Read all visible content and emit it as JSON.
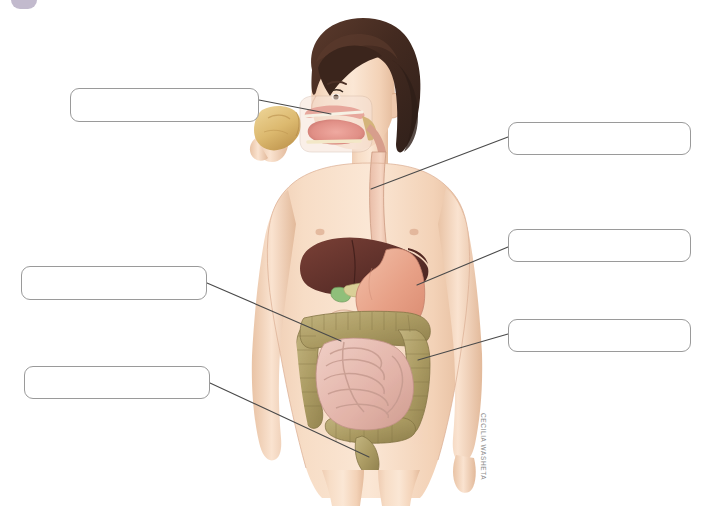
{
  "page": {
    "width": 713,
    "height": 510,
    "background": "#ffffff"
  },
  "credit": {
    "artist": "CECILIA WASHETA"
  },
  "answer_boxes": [
    {
      "id": "box-mouth",
      "label": "",
      "placeholder": "",
      "x": 70,
      "y": 88,
      "w": 189,
      "h": 34,
      "target_organ": "mouth"
    },
    {
      "id": "box-esophagus",
      "label": "",
      "placeholder": "",
      "x": 508,
      "y": 122,
      "w": 183,
      "h": 33,
      "target_organ": "esophagus"
    },
    {
      "id": "box-stomach",
      "label": "",
      "placeholder": "",
      "x": 508,
      "y": 229,
      "w": 183,
      "h": 33,
      "target_organ": "stomach"
    },
    {
      "id": "box-large-intestine",
      "label": "",
      "placeholder": "",
      "x": 21,
      "y": 266,
      "w": 186,
      "h": 34,
      "target_organ": "large-intestine"
    },
    {
      "id": "box-small-intestine",
      "label": "",
      "placeholder": "",
      "x": 508,
      "y": 319,
      "w": 183,
      "h": 33,
      "target_organ": "small-intestine"
    },
    {
      "id": "box-rectum-anus",
      "label": "",
      "placeholder": "",
      "x": 24,
      "y": 366,
      "w": 186,
      "h": 33,
      "target_organ": "rectum-anus"
    }
  ],
  "leader_lines": [
    {
      "id": "leader-mouth",
      "from": [
        259,
        100
      ],
      "to": [
        331,
        114
      ]
    },
    {
      "id": "leader-esophagus",
      "from": [
        508,
        137
      ],
      "to": [
        371,
        189
      ]
    },
    {
      "id": "leader-stomach",
      "from": [
        508,
        247
      ],
      "to": [
        417,
        285
      ]
    },
    {
      "id": "leader-large-intestine",
      "from": [
        207,
        283
      ],
      "to": [
        341,
        341
      ]
    },
    {
      "id": "leader-small-intestine",
      "from": [
        508,
        334
      ],
      "to": [
        418,
        360
      ]
    },
    {
      "id": "leader-rectum-anus",
      "from": [
        210,
        383
      ],
      "to": [
        369,
        457
      ]
    }
  ],
  "figure": {
    "name": "human-digestive-system-illustration",
    "organs": [
      {
        "name": "mouth",
        "color": "#e8a8a2"
      },
      {
        "name": "tongue",
        "color": "#d98e8a"
      },
      {
        "name": "esophagus",
        "color": "#e3b7a4"
      },
      {
        "name": "liver",
        "color": "#6d3a32"
      },
      {
        "name": "gallbladder",
        "color": "#8fbf7a"
      },
      {
        "name": "pancreas",
        "color": "#d8cf96"
      },
      {
        "name": "stomach",
        "color": "#e9a891"
      },
      {
        "name": "small-intestine",
        "color": "#e6bdb4"
      },
      {
        "name": "large-intestine",
        "color": "#b0a06a"
      },
      {
        "name": "rectum",
        "color": "#9c8b55"
      }
    ],
    "skin_tone": "#f3d3ba",
    "hair_color": "#4b3026",
    "food_item": {
      "name": "bread-slice",
      "color": "#e5c882"
    }
  },
  "colors": {
    "box_border": "#9a9a9a",
    "leader_line": "#4a4a4a",
    "credit_text": "#8d8d8d",
    "corner_mark": "#b7aec4",
    "page_background": "#ffffff"
  }
}
